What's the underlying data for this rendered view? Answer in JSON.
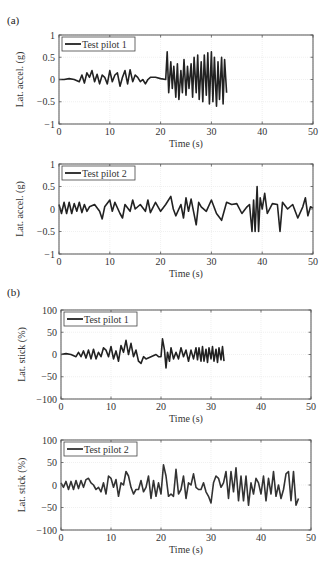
{
  "panels": [
    {
      "label": "(a)"
    },
    {
      "label": "(b)"
    }
  ],
  "chart_data": [
    {
      "type": "line",
      "panel": "(a)",
      "title": "",
      "xlabel": "Time (s)",
      "ylabel": "Lat. accel. (g)",
      "xlim": [
        0,
        50
      ],
      "ylim": [
        -1,
        1
      ],
      "xticks": [
        0,
        10,
        20,
        30,
        40,
        50
      ],
      "yticks": [
        1,
        0.5,
        0,
        -0.5,
        -1
      ],
      "ytick_labels": [
        "1",
        "0.5",
        "0",
        "−0.5",
        "−1"
      ],
      "grid": true,
      "legend_position": "upper left",
      "series": [
        {
          "name": "Test pilot 1",
          "color": "#222222",
          "x": [
            0,
            1,
            2,
            3,
            4,
            4.5,
            5,
            5.5,
            6,
            6.5,
            7,
            7.5,
            8,
            8.5,
            9,
            9.5,
            10,
            10.5,
            11,
            11.5,
            12,
            12.5,
            13,
            13.5,
            14,
            14.5,
            15,
            15.5,
            16,
            16.5,
            17,
            17.5,
            18,
            19,
            20,
            21,
            21.3,
            21.6,
            22,
            22.3,
            22.6,
            23,
            23.3,
            23.6,
            24,
            24.3,
            24.6,
            25,
            25.3,
            25.6,
            26,
            26.3,
            26.6,
            27,
            27.3,
            27.6,
            28,
            28.3,
            28.6,
            29,
            29.3,
            29.6,
            30,
            30.3,
            30.6,
            31,
            31.3,
            31.6,
            32,
            32.3,
            32.6,
            33
          ],
          "y": [
            0,
            0,
            0.02,
            0,
            -0.05,
            0.1,
            -0.08,
            0.15,
            0.05,
            0.2,
            -0.05,
            0.12,
            -0.1,
            0.1,
            0.05,
            -0.1,
            0.2,
            -0.05,
            0.1,
            0.15,
            -0.15,
            0.05,
            0.2,
            -0.1,
            0.22,
            -0.05,
            0.1,
            0.05,
            -0.05,
            0,
            -0.1,
            0,
            0.05,
            0.05,
            0.02,
            0,
            0.62,
            -0.3,
            0.4,
            -0.2,
            0.3,
            -0.4,
            0.35,
            -0.45,
            0.2,
            -0.3,
            0.45,
            -0.35,
            0.3,
            -0.2,
            0.35,
            -0.4,
            0.5,
            -0.3,
            0.55,
            -0.45,
            0.4,
            -0.5,
            0.55,
            -0.35,
            0.6,
            -0.55,
            0.62,
            -0.5,
            0.5,
            -0.6,
            0.4,
            -0.45,
            0.5,
            -0.55,
            0.45,
            -0.3
          ]
        }
      ]
    },
    {
      "type": "line",
      "panel": "(a)",
      "title": "",
      "xlabel": "Time (s)",
      "ylabel": "Lat. accel. (g)",
      "xlim": [
        0,
        50
      ],
      "ylim": [
        -1,
        1
      ],
      "xticks": [
        0,
        10,
        20,
        30,
        40,
        50
      ],
      "yticks": [
        1,
        0.5,
        0,
        -0.5,
        -1
      ],
      "ytick_labels": [
        "1",
        "0.5",
        "0",
        "−0.5",
        "−1"
      ],
      "grid": true,
      "legend_position": "upper left",
      "series": [
        {
          "name": "Test pilot 2",
          "color": "#222222",
          "x": [
            0,
            0.5,
            1,
            1.5,
            2,
            2.5,
            3,
            3.5,
            4,
            4.5,
            5,
            5.5,
            6,
            7,
            8,
            8.5,
            9,
            10,
            10.5,
            11,
            12,
            12.5,
            13,
            14,
            14.5,
            15,
            16,
            17,
            17.5,
            18,
            19,
            20,
            21,
            22,
            22.5,
            23,
            24,
            24.5,
            25,
            25.5,
            26,
            27,
            27.5,
            28,
            29,
            30,
            31,
            32,
            33,
            34,
            35,
            36,
            37,
            37.5,
            38,
            38.3,
            38.6,
            39,
            39.3,
            39.6,
            40,
            40.5,
            41,
            42,
            43,
            43.5,
            44,
            45,
            46,
            47,
            48,
            48.5,
            49,
            49.5,
            50
          ],
          "y": [
            0.1,
            -0.1,
            0.15,
            -0.1,
            0.15,
            -0.1,
            0.12,
            -0.05,
            0.15,
            -0.08,
            0.1,
            -0.05,
            0.05,
            0.1,
            -0.05,
            -0.22,
            0.05,
            0.2,
            -0.05,
            0.15,
            -0.1,
            -0.2,
            0.1,
            -0.05,
            0.2,
            0,
            0.1,
            -0.05,
            0.2,
            -0.08,
            0.15,
            -0.05,
            0.1,
            0.28,
            0,
            -0.15,
            0.1,
            -0.2,
            0.25,
            -0.05,
            0.22,
            -0.35,
            0.15,
            0.05,
            -0.05,
            0.2,
            -0.1,
            -0.25,
            0.15,
            0.1,
            0.12,
            -0.1,
            0.05,
            0.1,
            -0.5,
            0.2,
            -0.5,
            0.5,
            -0.5,
            0.25,
            0,
            0.35,
            -0.1,
            0.12,
            0.1,
            -0.5,
            0.15,
            0,
            0.1,
            -0.2,
            0.05,
            0.25,
            -0.15,
            0.05,
            0.02
          ]
        }
      ]
    },
    {
      "type": "line",
      "panel": "(b)",
      "title": "",
      "xlabel": "Time (s)",
      "ylabel": "Lat. stick (%)",
      "xlim": [
        0,
        50
      ],
      "ylim": [
        -100,
        100
      ],
      "xticks": [
        0,
        10,
        20,
        30,
        40,
        50
      ],
      "yticks": [
        100,
        50,
        0,
        -50,
        -100
      ],
      "ytick_labels": [
        "100",
        "50",
        "0",
        "−50",
        "−100"
      ],
      "grid": true,
      "legend_position": "upper left",
      "series": [
        {
          "name": "Test pilot 1",
          "color": "#222222",
          "x": [
            0,
            1,
            2,
            3,
            3.5,
            4,
            4.5,
            5,
            5.5,
            6,
            6.5,
            7,
            7.5,
            8,
            8.5,
            9,
            9.5,
            10,
            10.5,
            11,
            11.5,
            12,
            12.5,
            13,
            13.5,
            14,
            14.5,
            15,
            15.5,
            16,
            16.5,
            17,
            18,
            19,
            19.5,
            20,
            20.3,
            20.7,
            21,
            21.3,
            21.7,
            22,
            22.5,
            23,
            23.5,
            24,
            24.5,
            25,
            25.5,
            26,
            26.5,
            27,
            27.3,
            27.6,
            28,
            28.3,
            28.6,
            29,
            29.3,
            29.6,
            30,
            30.3,
            30.6,
            31,
            31.3,
            31.6,
            32,
            32.3,
            32.6
          ],
          "y": [
            0,
            2,
            0,
            -5,
            5,
            -5,
            8,
            -8,
            10,
            -10,
            12,
            -10,
            5,
            -5,
            15,
            10,
            -5,
            18,
            -10,
            8,
            -15,
            20,
            5,
            32,
            0,
            25,
            -5,
            10,
            -15,
            -20,
            -5,
            -10,
            -5,
            0,
            -5,
            -5,
            35,
            10,
            -30,
            5,
            -15,
            15,
            -10,
            5,
            -10,
            15,
            -5,
            10,
            -15,
            10,
            -10,
            15,
            -12,
            15,
            -15,
            18,
            -15,
            12,
            -18,
            15,
            -10,
            18,
            -15,
            12,
            -18,
            15,
            -12,
            18,
            -15
          ]
        }
      ]
    },
    {
      "type": "line",
      "panel": "(b)",
      "title": "",
      "xlabel": "Time (s)",
      "ylabel": "Lat. stick (%)",
      "xlim": [
        0,
        50
      ],
      "ylim": [
        -100,
        100
      ],
      "xticks": [
        0,
        10,
        20,
        30,
        40,
        50
      ],
      "yticks": [
        100,
        50,
        0,
        -50,
        -100
      ],
      "ytick_labels": [
        "100",
        "50",
        "0",
        "−50",
        "−100"
      ],
      "grid": true,
      "legend_position": "upper left",
      "series": [
        {
          "name": "Test pilot 2",
          "color": "#333333",
          "x": [
            0,
            0.5,
            1,
            1.5,
            2,
            2.5,
            3,
            3.5,
            4,
            4.5,
            5,
            5.5,
            6,
            6.5,
            7,
            7.5,
            8,
            8.5,
            9,
            9.5,
            10,
            10.5,
            11,
            11.5,
            12,
            12.5,
            13,
            13.5,
            14,
            14.5,
            15,
            15.5,
            16,
            16.5,
            17,
            17.5,
            18,
            18.5,
            19,
            19.5,
            20,
            20.5,
            21,
            21.5,
            22,
            22.5,
            23,
            23.5,
            24,
            24.5,
            25,
            25.5,
            26,
            26.5,
            27,
            27.5,
            28,
            28.5,
            29,
            29.5,
            30,
            30.5,
            31,
            31.5,
            32,
            32.5,
            33,
            33.5,
            34,
            34.5,
            35,
            35.5,
            36,
            36.5,
            37,
            37.5,
            38,
            38.5,
            39,
            39.5,
            40,
            40.5,
            41,
            41.5,
            42,
            42.5,
            43,
            43.5,
            44,
            44.5,
            45,
            45.5,
            46,
            46.5,
            47,
            47.5,
            48,
            48.5,
            49,
            49.5,
            50
          ],
          "y": [
            5,
            -5,
            8,
            -10,
            8,
            -10,
            10,
            -8,
            10,
            -5,
            12,
            15,
            5,
            0,
            -10,
            -5,
            -15,
            5,
            -20,
            20,
            15,
            -5,
            12,
            -25,
            5,
            0,
            30,
            20,
            -5,
            -20,
            -10,
            -10,
            10,
            -15,
            -5,
            20,
            -30,
            10,
            -25,
            5,
            -20,
            45,
            20,
            -25,
            -20,
            -25,
            35,
            -20,
            -10,
            20,
            -30,
            5,
            0,
            25,
            -5,
            -10,
            -10,
            5,
            -15,
            -25,
            -40,
            5,
            20,
            15,
            -5,
            5,
            30,
            -30,
            30,
            -15,
            38,
            -35,
            20,
            -35,
            20,
            -45,
            5,
            -20,
            15,
            5,
            -20,
            20,
            -35,
            15,
            -20,
            30,
            -25,
            0,
            -30,
            -10,
            25,
            30,
            -35,
            30,
            -45,
            -30
          ]
        }
      ]
    }
  ]
}
